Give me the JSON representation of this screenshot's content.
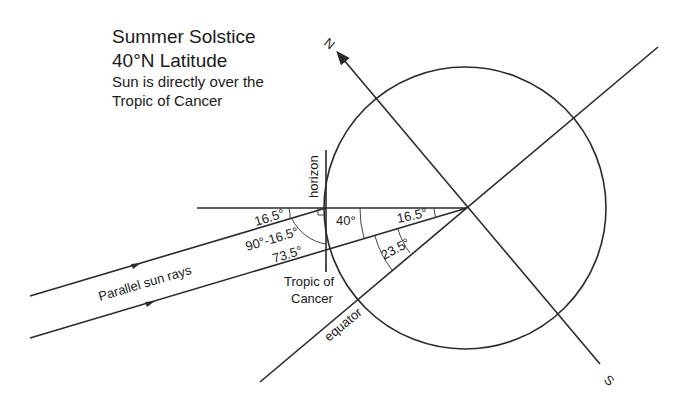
{
  "title": {
    "line1": "Summer Solstice",
    "line2": "40°N Latitude",
    "line3": "Sun is directly over the",
    "line4": "Tropic of Cancer"
  },
  "labels": {
    "north": "N",
    "south": "S",
    "horizon": "horizon",
    "equator": "equator",
    "tropic_line1": "Tropic of",
    "tropic_line2": "Cancer",
    "sun_rays": "Parallel sun rays"
  },
  "angles": {
    "ray_horizon": "16.5°",
    "complement_expr": "90°-16.5°",
    "complement_value": "73.5°",
    "latitude": "40°",
    "center_upper": "16.5°",
    "tilt": "23.5°"
  },
  "colors": {
    "line": "#2a2a2a",
    "text": "#1a1a1a",
    "background": "#ffffff"
  }
}
